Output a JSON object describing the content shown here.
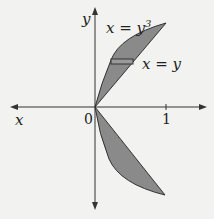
{
  "diagram": {
    "axes": {
      "x_label": "x",
      "y_label": "y",
      "origin_label": "0",
      "tick_label": "1"
    },
    "curves": [
      {
        "label": "x = y³",
        "base": "x = y",
        "exp": "3"
      },
      {
        "label": "x = y"
      }
    ],
    "colors": {
      "fill": "#8a8a8a",
      "stroke": "#333333",
      "background": "#f2f2f0"
    }
  }
}
